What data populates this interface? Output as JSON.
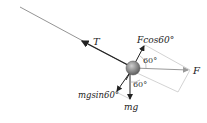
{
  "diagram": {
    "labels": {
      "tension": "T",
      "f_component": "Fcos60°",
      "force": "F",
      "weight": "mg",
      "weight_component": "mgsin60°"
    },
    "angles": {
      "upper": "60°",
      "lower": "60°"
    },
    "colors": {
      "rope": "#888888",
      "arrow": "#222222",
      "force_arrow": "#999999",
      "construction": "#c8c8c8",
      "ball": "#7a7a7a"
    }
  }
}
